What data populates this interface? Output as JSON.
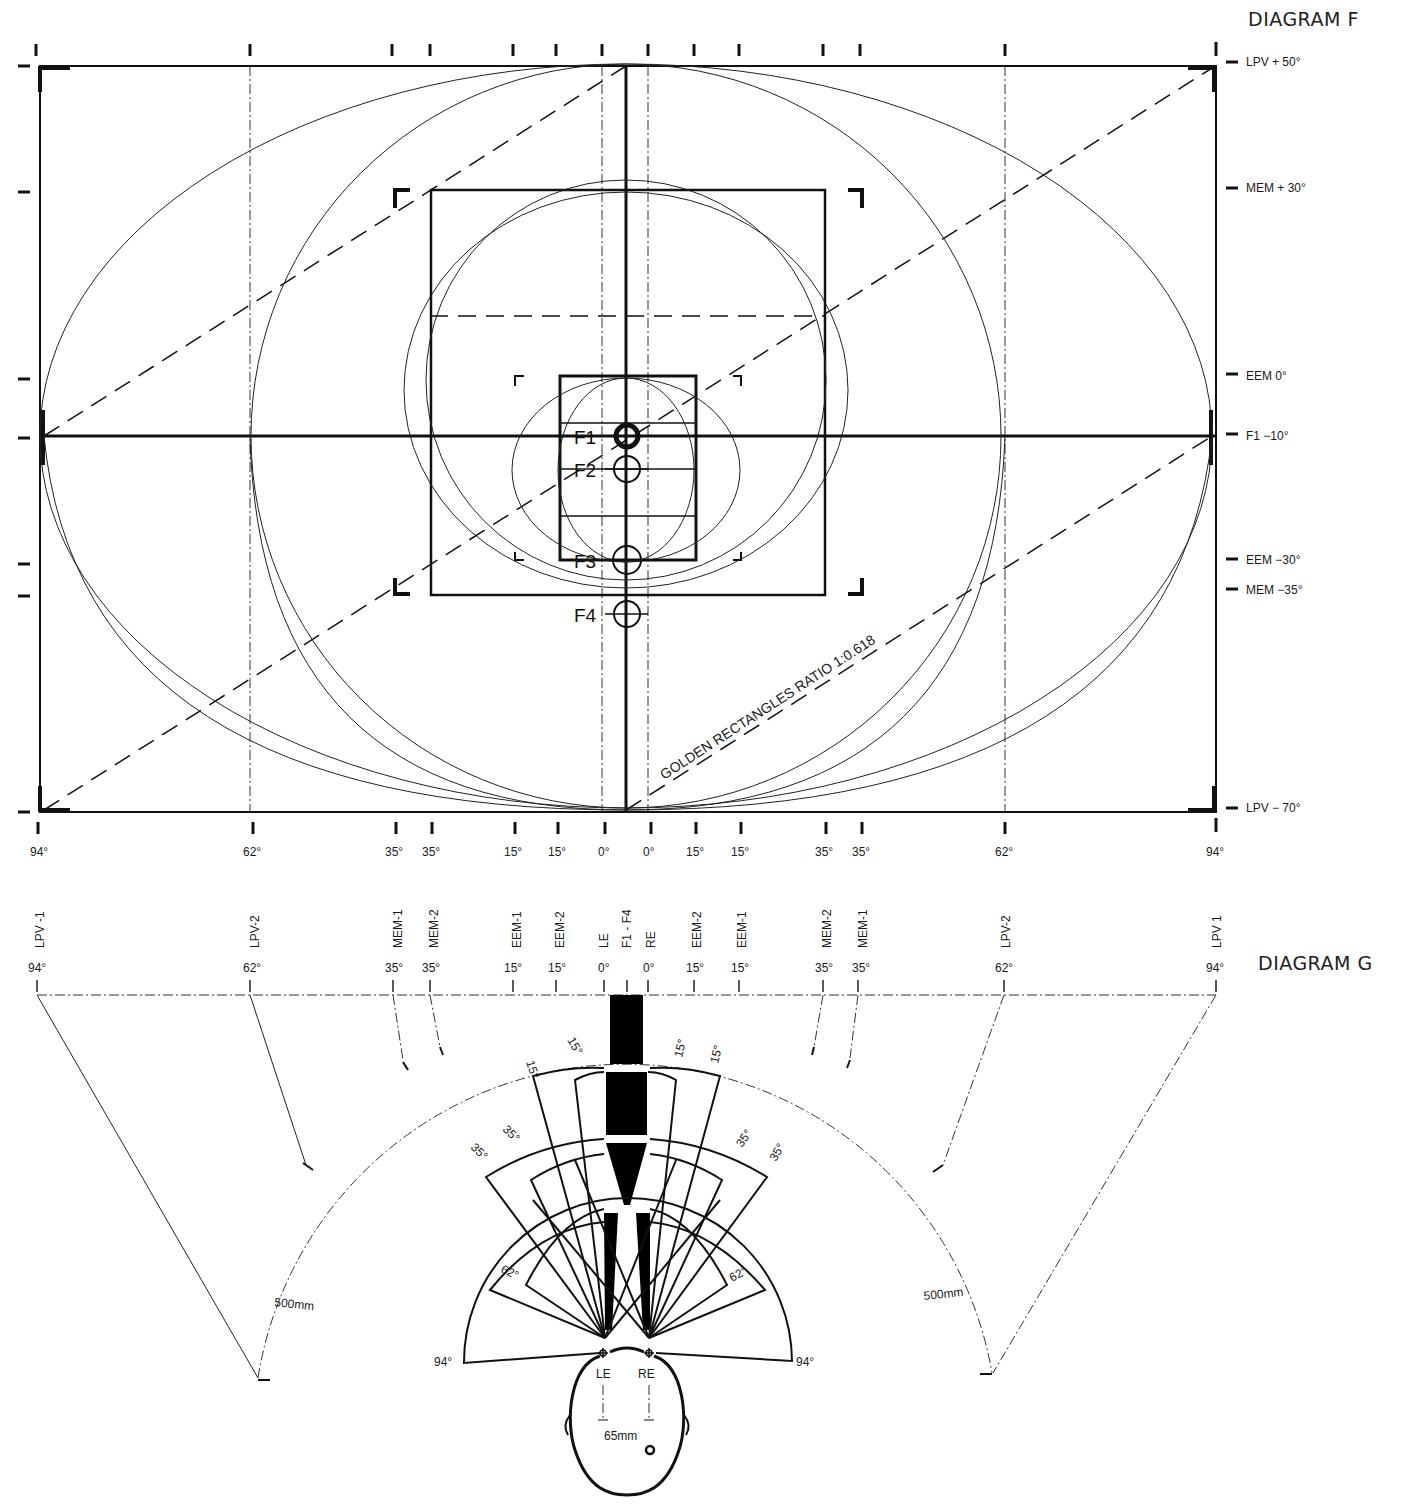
{
  "diagram_f": {
    "title": "DIAGRAM F",
    "right_labels": [
      {
        "text": "LPV + 50°",
        "y": 62
      },
      {
        "text": "MEM + 30°",
        "y": 188
      },
      {
        "text": "EEM 0°",
        "y": 376
      },
      {
        "text": "F1 −10°",
        "y": 436
      },
      {
        "text": "EEM −30°",
        "y": 560
      },
      {
        "text": "MEM −35°",
        "y": 590
      },
      {
        "text": "LPV − 70°",
        "y": 810
      }
    ],
    "bottom_labels": [
      {
        "text": "94°",
        "x": 40
      },
      {
        "text": "62°",
        "x": 253
      },
      {
        "text": "35°",
        "x": 396
      },
      {
        "text": "35°",
        "x": 432
      },
      {
        "text": "15°",
        "x": 515
      },
      {
        "text": "15°",
        "x": 558
      },
      {
        "text": "0°",
        "x": 605
      },
      {
        "text": "0°",
        "x": 651
      },
      {
        "text": "15°",
        "x": 696
      },
      {
        "text": "15°",
        "x": 741
      },
      {
        "text": "35°",
        "x": 826
      },
      {
        "text": "35°",
        "x": 862
      },
      {
        "text": "62°",
        "x": 1005
      },
      {
        "text": "94°",
        "x": 1216
      }
    ],
    "focal_points": [
      {
        "label": "F1",
        "y": 436
      },
      {
        "label": "F2",
        "y": 468
      },
      {
        "label": "F3",
        "y": 560
      },
      {
        "label": "F4",
        "y": 614
      }
    ],
    "annotation": "GOLDEN RECTANGLES RATIO 1:0.618"
  },
  "diagram_g": {
    "title": "DIAGRAM G",
    "columns": [
      {
        "name": "LPV -1",
        "deg": "94°",
        "x": 40
      },
      {
        "name": "LPV-2",
        "deg": "62°",
        "x": 253
      },
      {
        "name": "MEM-1",
        "deg": "35°",
        "x": 396
      },
      {
        "name": "MEM-2",
        "deg": "35°",
        "x": 432
      },
      {
        "name": "EEM-1",
        "deg": "15°",
        "x": 515
      },
      {
        "name": "EEM-2",
        "deg": "15°",
        "x": 558
      },
      {
        "name": "LE",
        "deg": "0°",
        "x": 605
      },
      {
        "name": "F1 - F4",
        "deg": "",
        "x": 628
      },
      {
        "name": "RE",
        "deg": "0°",
        "x": 651
      },
      {
        "name": "EEM-2",
        "deg": "15°",
        "x": 696
      },
      {
        "name": "EEM-1",
        "deg": "15°",
        "x": 741
      },
      {
        "name": "MEM-2",
        "deg": "35°",
        "x": 826
      },
      {
        "name": "MEM-1",
        "deg": "35°",
        "x": 862
      },
      {
        "name": "LPV-2",
        "deg": "62°",
        "x": 1005
      },
      {
        "name": "LPV 1",
        "deg": "94°",
        "x": 1216
      }
    ],
    "cone_labels": {
      "left_15a": "15°",
      "left_15b": "15°",
      "right_15a": "15°",
      "right_15b": "15°",
      "left_35a": "35°",
      "left_35b": "35°",
      "right_35a": "35°",
      "right_35b": "35°",
      "left_62": "62°",
      "right_62": "62°",
      "left_94": "94°",
      "right_94": "94°"
    },
    "radius_left": "500mm",
    "radius_right": "500mm",
    "left_eye": "LE",
    "right_eye": "RE",
    "eye_distance": "65mm"
  }
}
